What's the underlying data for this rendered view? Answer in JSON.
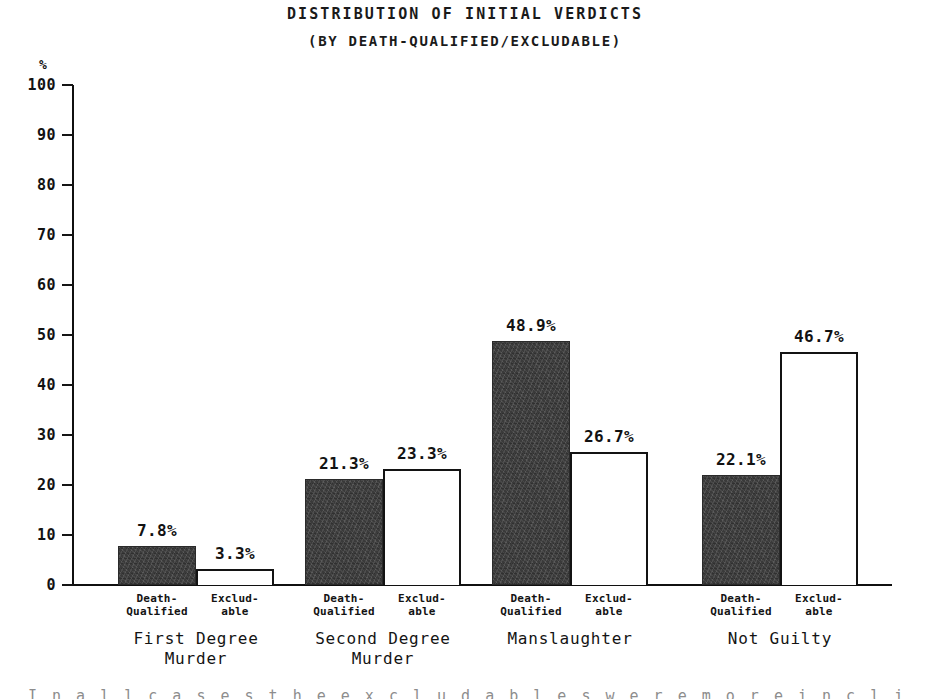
{
  "chart_data": {
    "type": "bar",
    "title": "Distribution of Initial Verdicts",
    "subtitle": "(By Death-Qualified/Excludable)",
    "xlabel": "",
    "ylabel": "%",
    "ylim": [
      0,
      100
    ],
    "ytick_step": 10,
    "yticks": [
      100,
      90,
      80,
      70,
      60,
      50,
      40,
      30,
      20,
      10,
      0
    ],
    "grid": false,
    "legend": "none",
    "categories": [
      "First Degree\nMurder",
      "Second Degree\nMurder",
      "Manslaughter",
      "Not Guilty"
    ],
    "series": [
      {
        "name": "Death-\nQualified",
        "style": "filled",
        "values": [
          7.8,
          21.3,
          48.9,
          22.1
        ],
        "labels": [
          "7.8%",
          "21.3%",
          "48.9%",
          "22.1%"
        ]
      },
      {
        "name": "Exclud-\nable",
        "style": "outlined",
        "values": [
          3.3,
          23.3,
          26.7,
          46.7
        ],
        "labels": [
          "3.3%",
          "23.3%",
          "26.7%",
          "46.7%"
        ]
      }
    ]
  },
  "axis": {
    "percent_symbol": "%",
    "tick_labels": [
      "100",
      "90",
      "80",
      "70",
      "60",
      "50",
      "40",
      "30",
      "20",
      "10",
      "0"
    ]
  },
  "page": {
    "bleed_text": "I n  a l l  c a s e s  t h e  e x c l u d a b l e s  w e r e  m o r e  i n c l i n e d"
  },
  "colors": {
    "ink": "#121212",
    "bar_filled": "#3a3a3a",
    "bar_outlined": "#ffffff",
    "background": "#ffffff"
  }
}
